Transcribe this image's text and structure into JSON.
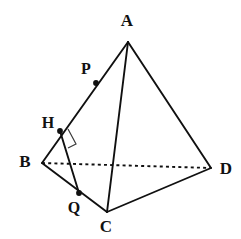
{
  "figure": {
    "kind": "tetrahedron-geometry-diagram",
    "width": 241,
    "height": 239,
    "background_color": "#ffffff",
    "stroke_color": "#101010",
    "label_color": "#111111",
    "right_angle_color": "#3a3a3a",
    "vertices": [
      {
        "id": "A",
        "label": "A",
        "x": 128,
        "y": 42,
        "label_x": 127,
        "label_y": 22,
        "label_pos": "above"
      },
      {
        "id": "B",
        "label": "B",
        "x": 42,
        "y": 163,
        "label_x": 25,
        "label_y": 163,
        "label_pos": "left"
      },
      {
        "id": "C",
        "label": "C",
        "x": 107,
        "y": 212,
        "label_x": 106,
        "label_y": 228,
        "label_pos": "below"
      },
      {
        "id": "D",
        "label": "D",
        "x": 211,
        "y": 168,
        "label_x": 226,
        "label_y": 170,
        "label_pos": "right"
      }
    ],
    "points": [
      {
        "id": "P",
        "label": "P",
        "x": 96,
        "y": 83,
        "label_x": 86,
        "label_y": 70,
        "on_segment": "AB",
        "label_pos": "upper-left"
      },
      {
        "id": "H",
        "label": "H",
        "x": 60,
        "y": 131,
        "label_x": 48,
        "label_y": 124,
        "on_segment": "AB",
        "label_pos": "upper-left"
      },
      {
        "id": "Q",
        "label": "Q",
        "x": 79,
        "y": 193,
        "label_x": 74,
        "label_y": 209,
        "on_segment": "BC",
        "label_pos": "below-left"
      }
    ],
    "edges": [
      {
        "id": "AB",
        "from": "A",
        "to": "B",
        "style": "solid",
        "visible": true
      },
      {
        "id": "AC",
        "from": "A",
        "to": "C",
        "style": "solid",
        "visible": true
      },
      {
        "id": "AD",
        "from": "A",
        "to": "D",
        "style": "solid",
        "visible": true
      },
      {
        "id": "BC",
        "from": "B",
        "to": "C",
        "style": "solid",
        "visible": true
      },
      {
        "id": "CD",
        "from": "C",
        "to": "D",
        "style": "solid",
        "visible": true
      },
      {
        "id": "BD",
        "from": "B",
        "to": "D",
        "style": "dashed",
        "visible": false
      }
    ],
    "auxiliary_segments": [
      {
        "id": "HQ",
        "from": "H",
        "to": "Q",
        "style": "solid"
      }
    ],
    "right_angle_markers": [
      {
        "id": "angle-at-H",
        "at_point": "H",
        "between": [
          "HA",
          "HQ"
        ],
        "symbol": "square"
      }
    ],
    "dash_pattern": "3 3.2"
  }
}
